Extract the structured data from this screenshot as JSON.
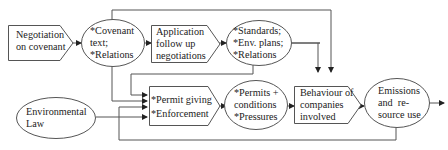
{
  "diagram": {
    "nodes": {
      "negotiation": {
        "shape": "pentagon",
        "lines": [
          "Negotiation",
          "on covenant"
        ]
      },
      "covenant": {
        "shape": "ellipse",
        "lines": [
          "*Covenant",
          "text;",
          "*Relations"
        ]
      },
      "application": {
        "shape": "pentagon",
        "lines": [
          "Application",
          "follow up",
          "negotiations"
        ]
      },
      "standards": {
        "shape": "ellipse",
        "lines": [
          "*Standards;",
          "*Env. plans;",
          "*Relations"
        ]
      },
      "env_law": {
        "shape": "ellipse",
        "lines": [
          "Environmental",
          "Law"
        ]
      },
      "permit": {
        "shape": "pentagon",
        "lines": [
          "*Permit giving",
          "*Enforcement"
        ]
      },
      "permits_cond": {
        "shape": "ellipse",
        "lines": [
          "*Permits +",
          "conditions",
          "*Pressures"
        ]
      },
      "behaviour": {
        "shape": "pentagon",
        "lines": [
          "Behaviour of",
          "companies",
          "involved"
        ]
      },
      "emissions": {
        "shape": "ellipse",
        "lines": [
          "Emissions",
          "and  re-",
          "source use"
        ]
      }
    },
    "colors": {
      "stroke": "#555555",
      "text": "#222222",
      "background": "#ffffff"
    }
  }
}
